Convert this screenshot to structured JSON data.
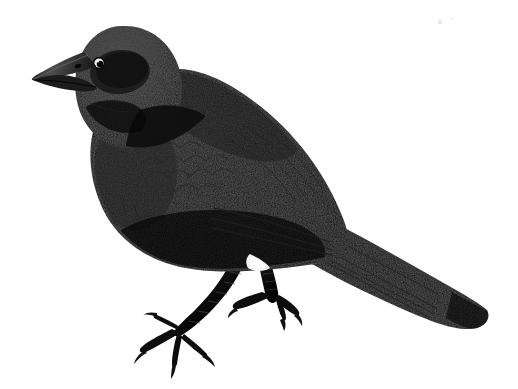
{
  "image": {
    "domain": "Natural-Image",
    "subject_label": "perched black bird (blackbird / cowbird) side profile, facing left",
    "medium_label": "engraved ink illustration with halftone stipple shading",
    "canvas": {
      "width": 518,
      "height": 389
    },
    "background_color": "#ffffff",
    "orientation": "bird faces left, tail extends to lower right"
  },
  "palette": {
    "background": "#ffffff",
    "plumage_black": "#0a0a0a",
    "plumage_core": "#000000",
    "head_dark_gray": "#242424",
    "head_mid_gray": "#2e2e2e",
    "crown_highlight": "#3c3c3c",
    "nape_shadow": "#141414",
    "beak_gray": "#333333",
    "beak_highlight": "#5a5a5a",
    "eye_ring_white": "#f2f2f2",
    "eye_pupil": "#000000",
    "feather_edge": "#1f1f1f",
    "wing_scallop": "#161616",
    "leg_black": "#101010",
    "leg_scale_highlight": "#4a4a4a",
    "vent_white": "#ffffff",
    "speck_gray": "#dcdcdc"
  },
  "anatomy": {
    "parts": [
      {
        "name": "beak",
        "tip_x": 32,
        "tip_y": 78,
        "length_px": 52,
        "shape": "short conical pointed"
      },
      {
        "name": "eye",
        "cx": 99,
        "cy": 63,
        "radius": 5,
        "highlight": "white ring with dark pupil"
      },
      {
        "name": "head",
        "crown_peak_x": 120,
        "crown_peak_y": 27
      },
      {
        "name": "nape",
        "x": 165,
        "y": 70
      },
      {
        "name": "back",
        "x": 250,
        "y": 130
      },
      {
        "name": "wing_coverts",
        "x": 190,
        "y": 155,
        "texture": "scalloped feather rows"
      },
      {
        "name": "breast",
        "x": 100,
        "y": 170
      },
      {
        "name": "belly",
        "x": 190,
        "y": 262
      },
      {
        "name": "vent_patch",
        "x": 262,
        "y": 268,
        "color": "#ffffff"
      },
      {
        "name": "left_leg",
        "tarsus_top_x": 240,
        "tarsus_top_y": 262,
        "foot_x": 178,
        "foot_y": 330
      },
      {
        "name": "right_leg",
        "tarsus_top_x": 268,
        "tarsus_top_y": 258,
        "foot_x": 272,
        "foot_y": 300
      },
      {
        "name": "tail",
        "base_x": 330,
        "base_y": 235,
        "tip_x": 486,
        "tip_y": 312,
        "shape": "long squared tip"
      }
    ],
    "claw_count_per_foot": 4
  },
  "accessibility": {
    "alt_text": "Black-and-white engraving of a black bird perched, facing left, with a long tail angled down to the right and scaly legs with curved claws."
  },
  "artifacts": {
    "specks": [
      {
        "x": 440,
        "y": 22,
        "r": 2.4
      },
      {
        "x": 452,
        "y": 19,
        "r": 1.2
      }
    ]
  }
}
